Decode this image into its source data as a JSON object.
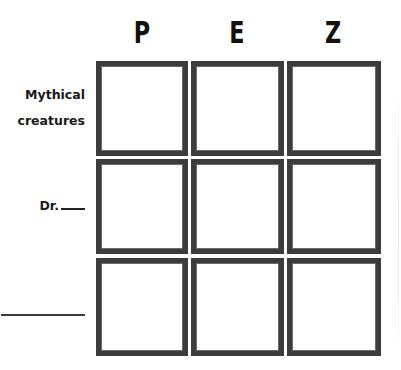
{
  "columns": [
    {
      "letter": "P"
    },
    {
      "letter": "E"
    },
    {
      "letter": "Z"
    }
  ],
  "rows": [
    {
      "label_line1": "Mythical",
      "label_line2": "creatures"
    },
    {
      "label_prefix": "Dr."
    },
    {
      "label_blank": ""
    }
  ],
  "grid": {
    "rows": 3,
    "cols": 3,
    "cells_filled": 0
  },
  "colors": {
    "border": "#3c3c3c",
    "text": "#111111",
    "background": "#ffffff"
  }
}
